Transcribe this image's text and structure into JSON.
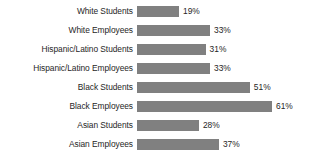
{
  "chart_data": {
    "type": "bar",
    "orientation": "horizontal",
    "title": "",
    "subtitle": "",
    "xlabel": "",
    "ylabel": "",
    "grid": false,
    "legend": false,
    "legend_position": "none",
    "xlim": [
      0,
      61
    ],
    "value_suffix": "%",
    "bar_color": "#808080",
    "label_color": "#262626",
    "background_color": "#ffffff",
    "categories": [
      "White Students",
      "White Employees",
      "Hispanic/Latino Students",
      "Hispanic/Latino Employees",
      "Black Students",
      "Black Employees",
      "Asian Students",
      "Asian Employees"
    ],
    "values": [
      19,
      33,
      31,
      33,
      51,
      61,
      28,
      37
    ],
    "value_labels": [
      "19%",
      "33%",
      "31%",
      "33%",
      "51%",
      "61%",
      "28%",
      "37%"
    ]
  }
}
